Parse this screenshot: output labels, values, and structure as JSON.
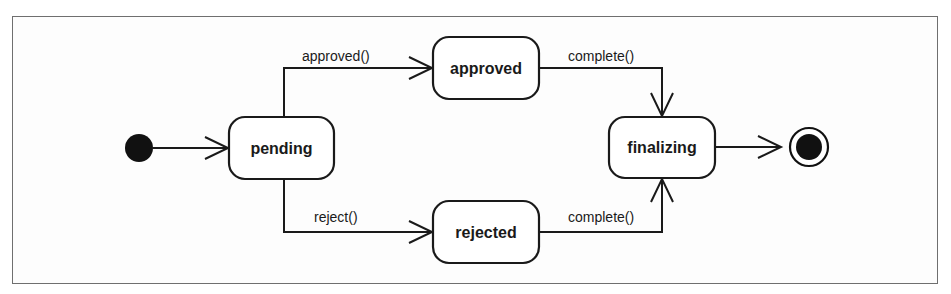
{
  "diagram": {
    "type": "uml-state-machine",
    "colors": {
      "stroke": "#1a1a1a",
      "background": "#ffffff",
      "frame": "#6f6f6f"
    },
    "initial_state": {
      "name": "initial"
    },
    "final_state": {
      "name": "final"
    },
    "states": [
      {
        "id": "pending",
        "label": "pending"
      },
      {
        "id": "approved",
        "label": "approved"
      },
      {
        "id": "rejected",
        "label": "rejected"
      },
      {
        "id": "finalizing",
        "label": "finalizing"
      }
    ],
    "transitions": [
      {
        "from": "initial",
        "to": "pending",
        "label": ""
      },
      {
        "from": "pending",
        "to": "approved",
        "label": "approved()"
      },
      {
        "from": "pending",
        "to": "rejected",
        "label": "reject()"
      },
      {
        "from": "approved",
        "to": "finalizing",
        "label": "complete()"
      },
      {
        "from": "rejected",
        "to": "finalizing",
        "label": "complete()"
      },
      {
        "from": "finalizing",
        "to": "final",
        "label": ""
      }
    ]
  }
}
